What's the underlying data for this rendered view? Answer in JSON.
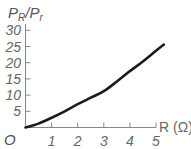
{
  "chart_data": {
    "type": "line",
    "title": "",
    "ylabel": "P_R / P_r",
    "xlabel": "R (Ω)",
    "origin_label": "O",
    "xlim": [
      0,
      5.3
    ],
    "ylim": [
      0,
      30
    ],
    "x_ticks": [
      "1",
      "2",
      "3",
      "4",
      "5"
    ],
    "y_ticks": [
      "5",
      "10",
      "15",
      "20",
      "25",
      "30"
    ],
    "grid": false,
    "legend": null,
    "series": [
      {
        "name": "P_R/P_r vs R",
        "color": "#1a1a1a",
        "x": [
          0,
          0.5,
          1,
          1.5,
          2,
          2.5,
          3,
          3.5,
          4,
          4.5,
          5,
          5.3
        ],
        "y": [
          0,
          1.2,
          3,
          5,
          7.2,
          9.2,
          11.2,
          14.2,
          17.4,
          20.4,
          23.7,
          25.6
        ]
      }
    ]
  },
  "labels": {
    "ylabel_main": "P",
    "ylabel_sub1": "R",
    "ylabel_slash": "/",
    "ylabel_main2": "P",
    "ylabel_sub2": "r",
    "xlabel": "R (Ω)",
    "origin": "O"
  }
}
